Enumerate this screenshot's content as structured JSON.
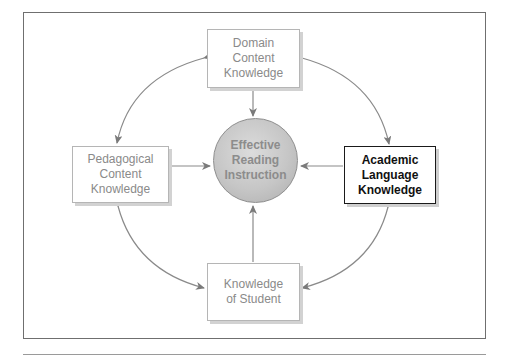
{
  "diagram": {
    "center": {
      "label": "Effective\nReading\nInstruction"
    },
    "nodes": {
      "top": {
        "label": "Domain\nContent\nKnowledge"
      },
      "left": {
        "label": "Pedagogical\nContent\nKnowledge"
      },
      "right": {
        "label": "Academic\nLanguage\nKnowledge",
        "highlighted": true
      },
      "bottom": {
        "label": "Knowledge\nof Student"
      }
    },
    "edges": [
      {
        "from": "top",
        "to": "center",
        "type": "one-way"
      },
      {
        "from": "left",
        "to": "center",
        "type": "one-way"
      },
      {
        "from": "right",
        "to": "center",
        "type": "one-way"
      },
      {
        "from": "bottom",
        "to": "center",
        "type": "one-way"
      },
      {
        "from": "top",
        "to": "left",
        "type": "bidirectional-curved"
      },
      {
        "from": "top",
        "to": "right",
        "type": "bidirectional-curved"
      },
      {
        "from": "left",
        "to": "bottom",
        "type": "bidirectional-curved"
      },
      {
        "from": "right",
        "to": "bottom",
        "type": "bidirectional-curved"
      }
    ],
    "colors": {
      "arrow": "#7a7a7a",
      "box_border": "#b5b5b5",
      "highlight_border": "#1a1a1a",
      "circle_fill": "#c6c6c6",
      "muted_text": "#8a8a8a"
    }
  }
}
